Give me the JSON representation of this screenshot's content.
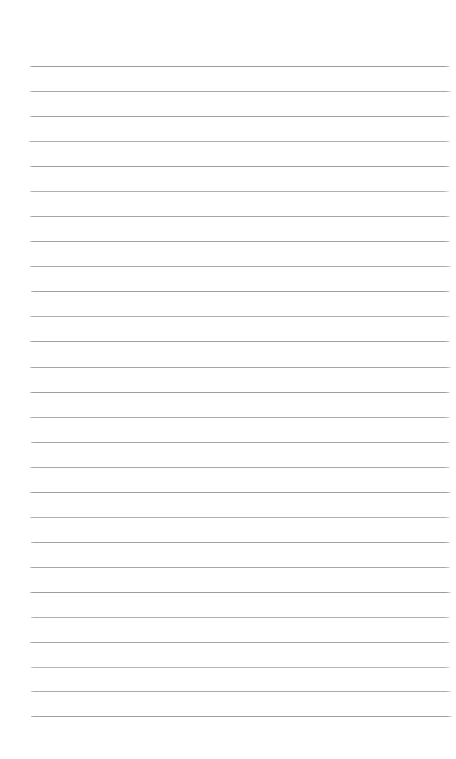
{
  "page": {
    "kind": "lined-paper-scan",
    "width": 456,
    "height": 759,
    "background_color": "#ffffff"
  },
  "ruling": {
    "line_color": "#a2a2a2",
    "line_count": 27,
    "line_thickness_px": 1,
    "line_spacing_px": 25,
    "left_margin_px": 30,
    "right_edge_px": 450,
    "first_line_y_px": 66,
    "last_line_y_px": 716,
    "has_vertical_margin_rule": false,
    "lines": [
      {
        "y": 66,
        "x1": 30,
        "x2": 450,
        "color": "#9b9b9b",
        "opacity": 1.0
      },
      {
        "y": 91,
        "x1": 30,
        "x2": 451,
        "color": "#a4a4a4",
        "opacity": 0.96
      },
      {
        "y": 116,
        "x1": 30,
        "x2": 450,
        "color": "#a0a0a0",
        "opacity": 0.98
      },
      {
        "y": 141,
        "x1": 29,
        "x2": 450,
        "color": "#a8a8a8",
        "opacity": 0.94
      },
      {
        "y": 166,
        "x1": 30,
        "x2": 450,
        "color": "#9c9c9c",
        "opacity": 1.0
      },
      {
        "y": 191,
        "x1": 30,
        "x2": 449,
        "color": "#ababab",
        "opacity": 0.92
      },
      {
        "y": 216,
        "x1": 30,
        "x2": 450,
        "color": "#a2a2a2",
        "opacity": 0.97
      },
      {
        "y": 241,
        "x1": 30,
        "x2": 450,
        "color": "#a0a0a0",
        "opacity": 0.98
      },
      {
        "y": 266,
        "x1": 30,
        "x2": 451,
        "color": "#a6a6a6",
        "opacity": 0.95
      },
      {
        "y": 291,
        "x1": 31,
        "x2": 450,
        "color": "#9e9e9e",
        "opacity": 0.99
      },
      {
        "y": 316,
        "x1": 30,
        "x2": 450,
        "color": "#a9a9a9",
        "opacity": 0.93
      },
      {
        "y": 341,
        "x1": 30,
        "x2": 450,
        "color": "#9f9f9f",
        "opacity": 0.98
      },
      {
        "y": 367,
        "x1": 30,
        "x2": 451,
        "color": "#a3a3a3",
        "opacity": 0.96
      },
      {
        "y": 392,
        "x1": 30,
        "x2": 450,
        "color": "#9d9d9d",
        "opacity": 1.0
      },
      {
        "y": 417,
        "x1": 30,
        "x2": 450,
        "color": "#a7a7a7",
        "opacity": 0.94
      },
      {
        "y": 442,
        "x1": 31,
        "x2": 450,
        "color": "#a1a1a1",
        "opacity": 0.97
      },
      {
        "y": 467,
        "x1": 30,
        "x2": 450,
        "color": "#a5a5a5",
        "opacity": 0.95
      },
      {
        "y": 492,
        "x1": 30,
        "x2": 451,
        "color": "#9e9e9e",
        "opacity": 0.99
      },
      {
        "y": 517,
        "x1": 30,
        "x2": 450,
        "color": "#aaaaaa",
        "opacity": 0.92
      },
      {
        "y": 542,
        "x1": 31,
        "x2": 450,
        "color": "#a0a0a0",
        "opacity": 0.98
      },
      {
        "y": 567,
        "x1": 30,
        "x2": 450,
        "color": "#a4a4a4",
        "opacity": 0.96
      },
      {
        "y": 592,
        "x1": 30,
        "x2": 451,
        "color": "#9c9c9c",
        "opacity": 1.0
      },
      {
        "y": 617,
        "x1": 31,
        "x2": 450,
        "color": "#a8a8a8",
        "opacity": 0.93
      },
      {
        "y": 642,
        "x1": 30,
        "x2": 450,
        "color": "#a2a2a2",
        "opacity": 0.97
      },
      {
        "y": 667,
        "x1": 31,
        "x2": 450,
        "color": "#adadad",
        "opacity": 0.9
      },
      {
        "y": 691,
        "x1": 31,
        "x2": 451,
        "color": "#a6a6a6",
        "opacity": 0.95
      },
      {
        "y": 716,
        "x1": 31,
        "x2": 452,
        "color": "#9f9f9f",
        "opacity": 0.98
      }
    ]
  },
  "margins": {
    "top_blank_px": 66,
    "bottom_blank_px": 43
  },
  "content": {
    "written_text": "",
    "note": "No handwriting or printed text present on the page"
  }
}
